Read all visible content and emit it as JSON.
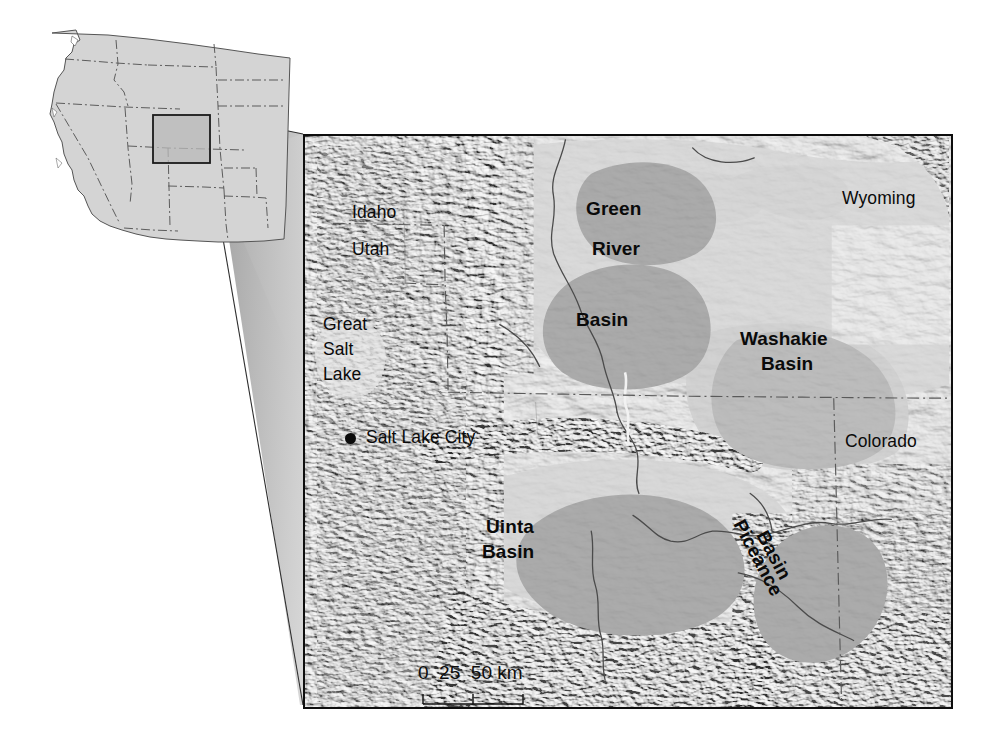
{
  "figure": {
    "type": "reference-map",
    "background_color": "#ffffff"
  },
  "inset_map": {
    "name": "western-united-states-inset",
    "land_fill": "#d4d4d4",
    "outline_color": "#4a4a4a",
    "state_border_style": "dash-dot",
    "highlight_rect": {
      "stroke": "#1a1a1a",
      "fill": "#b9b9b9",
      "label": ""
    }
  },
  "connector": {
    "name": "inset-to-map-connector",
    "fill_start": "#9e9e9e",
    "fill_end": "#ffffff",
    "stroke": "#2a2a2a"
  },
  "main_map": {
    "frame_color": "#0d0d0d",
    "terrain_base": "#dedede",
    "basin_fill": "#9b9b9b",
    "plateau_fill": "#c9c9c9",
    "state_line_color": "#5a5a5a",
    "river_color": "#4b4b4b",
    "labels": {
      "states": [
        {
          "text": "Idaho",
          "x": 352,
          "y": 213,
          "style": "plain"
        },
        {
          "text": "Utah",
          "x": 352,
          "y": 249,
          "style": "plain"
        },
        {
          "text": "Wyoming",
          "x": 842,
          "y": 198,
          "style": "plain"
        },
        {
          "text": "Colorado",
          "x": 845,
          "y": 441,
          "style": "plain"
        }
      ],
      "features": [
        {
          "text": "Great",
          "x": 325,
          "y": 325,
          "style": "plain"
        },
        {
          "text": "Salt",
          "x": 325,
          "y": 350,
          "style": "plain"
        },
        {
          "text": "Lake",
          "x": 325,
          "y": 375,
          "style": "plain"
        }
      ],
      "city": {
        "name": "Salt Lake City",
        "dot_x": 348,
        "dot_y": 437,
        "label_x": 368,
        "label_y": 429
      },
      "basins": [
        {
          "text": "Green",
          "x": 588,
          "y": 200,
          "style": "bold-lg"
        },
        {
          "text": "River",
          "x": 592,
          "y": 240,
          "style": "bold-lg"
        },
        {
          "text": "Basin",
          "x": 578,
          "y": 311,
          "style": "bold-lg"
        },
        {
          "text": "Washakie",
          "x": 742,
          "y": 330,
          "style": "bold-lg"
        },
        {
          "text": "Basin",
          "x": 762,
          "y": 354,
          "style": "bold-lg"
        },
        {
          "text": "Uinta",
          "x": 487,
          "y": 518,
          "style": "bold-lg"
        },
        {
          "text": "Basin",
          "x": 483,
          "y": 543,
          "style": "bold-lg"
        }
      ],
      "rotated_basins": [
        {
          "text": "Piceance",
          "x": 760,
          "y": 532,
          "rotation": 62,
          "style": "bold-lg"
        },
        {
          "text": "Basin",
          "x": 775,
          "y": 560,
          "rotation": 62,
          "style": "bold-lg"
        }
      ]
    },
    "scale_bar": {
      "name": "map-scale-bar",
      "labels": [
        "0",
        "25",
        "50",
        "km"
      ],
      "label_text": "0  25  50 km",
      "units": "km",
      "max_value": 50,
      "tick_values": [
        0,
        25,
        50
      ],
      "x": 418,
      "y": 664,
      "bar_x": 423,
      "bar_y": 697,
      "bar_width": 100
    }
  },
  "named_basins": [
    "Green River Basin",
    "Washakie Basin",
    "Uinta Basin",
    "Piceance Basin"
  ],
  "named_states": [
    "Idaho",
    "Utah",
    "Wyoming",
    "Colorado"
  ],
  "named_places": [
    "Great Salt Lake",
    "Salt Lake City"
  ]
}
